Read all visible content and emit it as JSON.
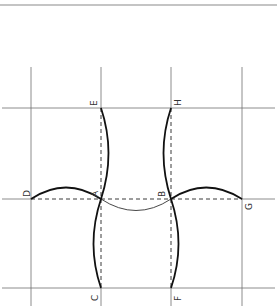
{
  "diagram": {
    "type": "geometric-construction",
    "colors": {
      "background": "#ffffff",
      "grid_line": "#6e6e6e",
      "top_rule": "#8a8a8a",
      "dashed_line": "#3a3a3a",
      "curve": "#111111",
      "label": "#333333"
    },
    "points": {
      "A": {
        "label": "A",
        "x": 101,
        "y": 199
      },
      "B": {
        "label": "B",
        "x": 171,
        "y": 199
      },
      "C": {
        "label": "C",
        "x": 101,
        "y": 288
      },
      "D": {
        "label": "D",
        "x": 31,
        "y": 199
      },
      "E": {
        "label": "E",
        "x": 101,
        "y": 108
      },
      "F": {
        "label": "F",
        "x": 171,
        "y": 288
      },
      "G": {
        "label": "G",
        "x": 242,
        "y": 199
      },
      "H": {
        "label": "H",
        "x": 171,
        "y": 108
      }
    },
    "labels": [
      "A",
      "B",
      "C",
      "D",
      "E",
      "F",
      "G",
      "H"
    ]
  }
}
